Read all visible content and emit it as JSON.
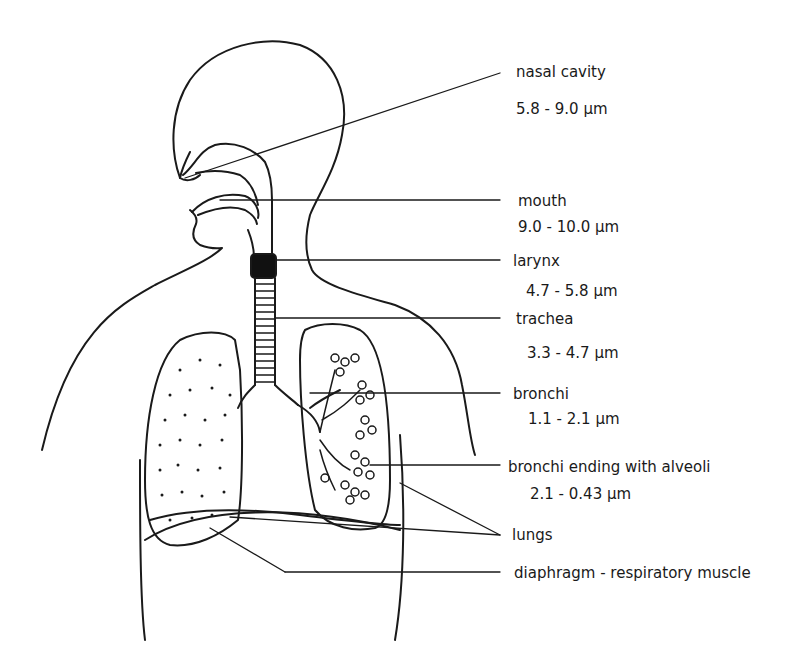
{
  "diagram": {
    "labels": [
      {
        "name": "nasal cavity",
        "range": "5.8 - 9.0  µm"
      },
      {
        "name": "mouth",
        "range": "9.0 - 10.0  µm"
      },
      {
        "name": "larynx",
        "range": "4.7 - 5.8  µm"
      },
      {
        "name": "trachea",
        "range": "3.3 - 4.7  µm"
      },
      {
        "name": "bronchi",
        "range": "1.1 - 2.1  µm"
      },
      {
        "name": "bronchi ending with alveoli",
        "range": "2.1 - 0.43  µm"
      },
      {
        "name": "lungs",
        "range": ""
      },
      {
        "name": "diaphragm - respiratory muscle",
        "range": ""
      }
    ],
    "colors": {
      "line": "#1a1a1a",
      "background": "#ffffff"
    }
  }
}
